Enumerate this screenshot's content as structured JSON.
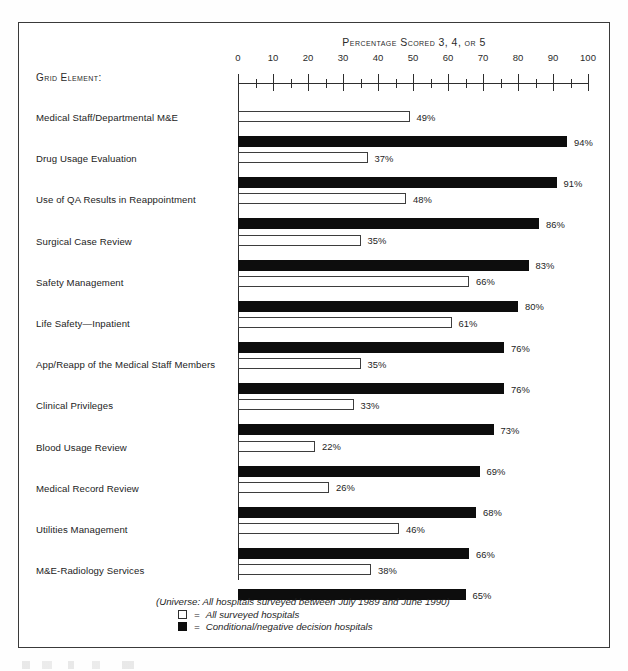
{
  "chart_data": {
    "type": "bar",
    "orientation": "horizontal",
    "title": "Percentage Scored 3, 4, or 5",
    "xlabel": "",
    "ylabel": "Grid Element:",
    "xlim": [
      0,
      100
    ],
    "grid": false,
    "legend_position": "bottom-left",
    "axis_ticks": [
      0,
      10,
      20,
      30,
      40,
      50,
      60,
      70,
      80,
      90,
      100
    ],
    "minor_tick_step": 5,
    "categories": [
      "Medical Staff/Departmental M&E",
      "Drug Usage Evaluation",
      "Use of QA Results in Reappointment",
      "Surgical Case Review",
      "Safety Management",
      "Life Safety—Inpatient",
      "App/Reapp of the Medical Staff Members",
      "Clinical Privileges",
      "Blood Usage Review",
      "Medical Record Review",
      "Utilities Management",
      "M&E-Radiology Services"
    ],
    "series": [
      {
        "name": "All surveyed hospitals",
        "style": "open",
        "values": [
          49,
          37,
          48,
          35,
          66,
          61,
          35,
          33,
          22,
          26,
          46,
          38
        ],
        "labels": [
          "49%",
          "37%",
          "48%",
          "35%",
          "66%",
          "61%",
          "35%",
          "33%",
          "22%",
          "26%",
          "46%",
          "38%"
        ]
      },
      {
        "name": "Conditional/negative decision hospitals",
        "style": "solid",
        "values": [
          94,
          91,
          86,
          83,
          80,
          76,
          76,
          73,
          69,
          68,
          66,
          65
        ],
        "labels": [
          "94%",
          "91%",
          "86%",
          "83%",
          "80%",
          "76%",
          "76%",
          "73%",
          "69%",
          "68%",
          "66%",
          "65%"
        ]
      }
    ],
    "annotations": [
      "(Universe: All hospitals surveyed between July 1989 and June 1990)"
    ]
  },
  "legend": {
    "universe_note": "(Universe: All hospitals surveyed between July 1989 and June 1990)",
    "equals": "=",
    "entries": [
      {
        "swatch": "open",
        "label": "All surveyed hospitals"
      },
      {
        "swatch": "solid",
        "label": "Conditional/negative decision hospitals"
      }
    ]
  },
  "colors": {
    "solid_bar": "#0d0d0d",
    "open_bar_border": "#3d3d3d",
    "axis": "#2e2e2e",
    "frame": "#3a3a3a",
    "text": "#232323",
    "page_background": "#ffffff"
  }
}
